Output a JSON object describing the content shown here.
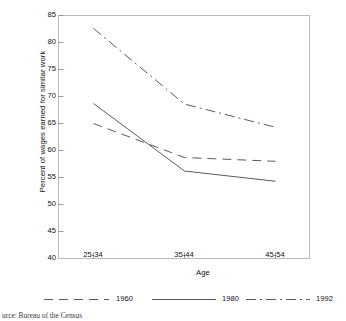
{
  "chart_data": {
    "type": "line",
    "title": "",
    "xlabel": "Age",
    "ylabel": "Percent of wages earned for similar work",
    "categories": [
      "25-34",
      "35-44",
      "45-54"
    ],
    "yticks": [
      40,
      45,
      50,
      55,
      60,
      65,
      70,
      75,
      80,
      85
    ],
    "ylim": [
      40,
      85
    ],
    "grid": false,
    "legend_position": "bottom",
    "series": [
      {
        "name": "1960",
        "values": [
          65.0,
          58.7,
          58.0
        ],
        "style": "dashed",
        "color": "#5a5a5a"
      },
      {
        "name": "1980",
        "values": [
          68.7,
          56.2,
          54.3
        ],
        "style": "solid",
        "color": "#5a5a5a"
      },
      {
        "name": "1992",
        "values": [
          82.6,
          68.6,
          64.3
        ],
        "style": "dash-dot",
        "color": "#5a5a5a"
      }
    ],
    "source_note": "urce: Bureau of the Census"
  },
  "axes": {
    "frame_color": "#b9b9b9"
  }
}
